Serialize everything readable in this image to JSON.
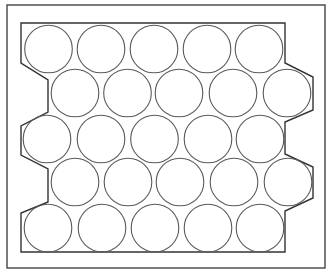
{
  "diagram": {
    "width": 332,
    "height": 274,
    "background": "#ffffff",
    "outer_frame": {
      "x": 7,
      "y": 5,
      "width": 318,
      "height": 263,
      "stroke": "#444444",
      "stroke_width": 1.4
    },
    "inner_boundary": {
      "stroke": "#333333",
      "stroke_width": 1.4,
      "points": [
        [
          21,
          23
        ],
        [
          285,
          23
        ],
        [
          285,
          63
        ],
        [
          313,
          77
        ],
        [
          313,
          110
        ],
        [
          285,
          122
        ],
        [
          285,
          154
        ],
        [
          313,
          167
        ],
        [
          313,
          198
        ],
        [
          285,
          211
        ],
        [
          285,
          252
        ],
        [
          21,
          252
        ],
        [
          21,
          213
        ],
        [
          48,
          202
        ],
        [
          48,
          169
        ],
        [
          21,
          155
        ],
        [
          21,
          126
        ],
        [
          48,
          112
        ],
        [
          48,
          80
        ],
        [
          21,
          63
        ]
      ]
    },
    "circle_style": {
      "r": 23.8,
      "stroke": "#5a5a5a",
      "stroke_width": 1.1,
      "fill": "none"
    },
    "rows": [
      {
        "cy": 49,
        "cx": [
          48.5,
          101,
          154,
          207,
          259
        ]
      },
      {
        "cy": 93,
        "cx": [
          75,
          127.5,
          179,
          233,
          287
        ]
      },
      {
        "cy": 139,
        "cx": [
          47,
          101,
          154.5,
          208,
          260
        ]
      },
      {
        "cy": 182,
        "cx": [
          75,
          128,
          180,
          234,
          288
        ]
      },
      {
        "cy": 228,
        "cx": [
          48,
          102,
          155,
          208,
          260
        ]
      }
    ],
    "circle_count": 25
  }
}
